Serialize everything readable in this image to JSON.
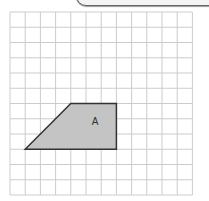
{
  "grid": {
    "cols": 12,
    "rows": 12,
    "x0": 10,
    "y0": 12,
    "cell_w": 15.2,
    "cell_h": 15.25,
    "line_color": "#cccccc"
  },
  "shape": {
    "label": "A",
    "fill": "#c4c4c4",
    "stroke": "#333333",
    "vertices_grid": [
      [
        1,
        9
      ],
      [
        4,
        6
      ],
      [
        7,
        6
      ],
      [
        7,
        9
      ]
    ]
  }
}
